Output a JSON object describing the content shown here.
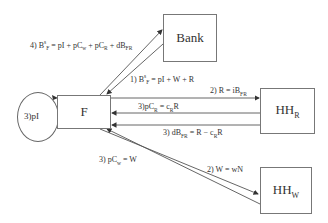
{
  "nodes": {
    "bank": {
      "label": "Bank"
    },
    "firm": {
      "label": "F"
    },
    "hh_r": {
      "label": "HH",
      "sub": "R"
    },
    "hh_w": {
      "label": "HH",
      "sub": "W"
    }
  },
  "loop": {
    "label": "3)pI"
  },
  "edges": {
    "e4": {
      "prefix": "4) B",
      "sup": "s",
      "sub": "F",
      "rest1": " = pI + pC",
      "sub2": "w",
      "rest2": " + pC",
      "sub3": "R",
      "rest3": " + dB",
      "sub4": "FR"
    },
    "e1": {
      "prefix": "1) B",
      "sup": "s",
      "sub": "F",
      "rest": " = pI + W + R"
    },
    "e2r": {
      "prefix": "2) R = iB",
      "sub": "FR"
    },
    "e3pc": {
      "prefix": "3)pC",
      "sub": "R",
      "mid": " = c",
      "sub2": "R",
      "rest": "R"
    },
    "e3db": {
      "prefix": "3) dB",
      "sub": "FR",
      "mid": " = R − c",
      "sub2": "R",
      "rest": "R"
    },
    "e3w": {
      "prefix": "3) pC",
      "sub": "w",
      "rest": " = W"
    },
    "e2w": {
      "text": "2) W = wN"
    }
  },
  "colors": {
    "line": "#555555",
    "border": "#777777",
    "text": "#333333"
  }
}
